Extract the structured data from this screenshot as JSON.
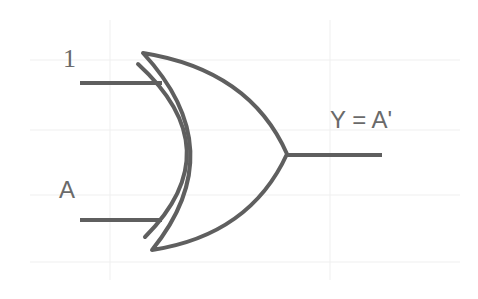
{
  "diagram": {
    "type": "logic-gate",
    "gate": "XOR",
    "inputs": [
      {
        "id": "in1",
        "label": "1"
      },
      {
        "id": "in2",
        "label": "A"
      }
    ],
    "output": {
      "id": "out",
      "label": "Y = A'"
    },
    "colors": {
      "stroke": "#5f5f5f",
      "text": "#6a6a6a",
      "background": "#ffffff"
    }
  }
}
